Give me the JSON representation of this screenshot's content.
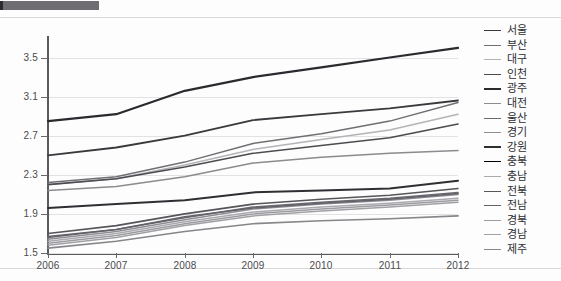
{
  "chart_data": {
    "type": "line",
    "title": "",
    "xlabel": "",
    "ylabel": "",
    "grid": true,
    "legend_position": "right",
    "x": [
      2006,
      2007,
      2008,
      2009,
      2010,
      2011,
      2012
    ],
    "xticklabels": [
      "2006",
      "2007",
      "2008",
      "2009",
      "2010",
      "2011",
      "2012"
    ],
    "yticklabels": [
      "3.5",
      "3.1",
      "2.7",
      "2.3",
      "1.9",
      "1.5"
    ],
    "yticks": [
      3.5,
      3.1,
      2.7,
      2.3,
      1.9,
      1.5
    ],
    "ylim": [
      1.5,
      3.7
    ],
    "xlim": [
      2006,
      2012
    ],
    "series": [
      {
        "name": "서울",
        "color": "#3a3a3e",
        "width": 1.8,
        "values": [
          2.5,
          2.58,
          2.7,
          2.86,
          2.92,
          2.98,
          3.06
        ]
      },
      {
        "name": "부산",
        "color": "#6f6f74",
        "width": 1.5,
        "values": [
          2.22,
          2.28,
          2.43,
          2.62,
          2.72,
          2.85,
          3.04
        ]
      },
      {
        "name": "대구",
        "color": "#b4b4b8",
        "width": 1.5,
        "values": [
          2.2,
          2.26,
          2.4,
          2.56,
          2.66,
          2.76,
          2.92
        ]
      },
      {
        "name": "인천",
        "color": "#4c4c50",
        "width": 1.6,
        "values": [
          2.2,
          2.26,
          2.38,
          2.52,
          2.6,
          2.68,
          2.82
        ]
      },
      {
        "name": "광주",
        "color": "#2b2b2f",
        "width": 2.2,
        "values": [
          2.85,
          2.92,
          3.16,
          3.3,
          3.4,
          3.5,
          3.6
        ]
      },
      {
        "name": "대전",
        "color": "#8b8b90",
        "width": 1.5,
        "values": [
          2.14,
          2.18,
          2.28,
          2.42,
          2.48,
          2.52,
          2.55
        ]
      },
      {
        "name": "울산",
        "color": "#6a6a6e",
        "width": 1.5,
        "values": [
          1.66,
          1.74,
          1.86,
          1.97,
          2.02,
          2.06,
          2.12
        ]
      },
      {
        "name": "경기",
        "color": "#8e8e93",
        "width": 1.5,
        "values": [
          1.64,
          1.72,
          1.84,
          1.95,
          2.0,
          2.04,
          2.1
        ]
      },
      {
        "name": "강원",
        "color": "#2f2f33",
        "width": 2.0,
        "values": [
          1.96,
          2.0,
          2.04,
          2.12,
          2.14,
          2.16,
          2.24
        ]
      },
      {
        "name": "충북",
        "color": "#777, ",
        "width": 1.5,
        "values": [
          1.68,
          1.75,
          1.88,
          1.99,
          2.04,
          2.08,
          2.14
        ]
      },
      {
        "name": "충남",
        "color": "#a9a9ae",
        "width": 1.5,
        "values": [
          1.62,
          1.7,
          1.82,
          1.92,
          1.97,
          2.01,
          2.06
        ]
      },
      {
        "name": "전북",
        "color": "#55555a",
        "width": 1.6,
        "values": [
          1.7,
          1.78,
          1.9,
          2.0,
          2.05,
          2.09,
          2.16
        ]
      },
      {
        "name": "전남",
        "color": "#62626a",
        "width": 1.5,
        "values": [
          1.67,
          1.74,
          1.87,
          1.96,
          2.01,
          2.05,
          2.11
        ]
      },
      {
        "name": "경북",
        "color": "#9b9ba0",
        "width": 1.5,
        "values": [
          1.6,
          1.68,
          1.8,
          1.9,
          1.95,
          1.99,
          2.04
        ]
      },
      {
        "name": "경남",
        "color": "#a0a0a5",
        "width": 1.5,
        "values": [
          1.58,
          1.66,
          1.78,
          1.88,
          1.93,
          1.97,
          2.02
        ]
      },
      {
        "name": "제주",
        "color": "#86868b",
        "width": 1.6,
        "values": [
          1.55,
          1.62,
          1.72,
          1.8,
          1.83,
          1.85,
          1.88
        ]
      }
    ]
  }
}
